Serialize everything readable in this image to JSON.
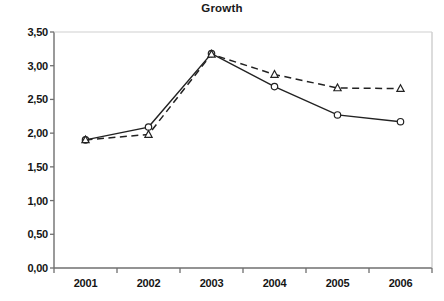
{
  "chart_data": {
    "type": "line",
    "title": "Growth",
    "xlabel": "",
    "ylabel": "",
    "categories": [
      "2001",
      "2002",
      "2003",
      "2004",
      "2005",
      "2006"
    ],
    "ylim": [
      0.0,
      3.5
    ],
    "ytick_step": 0.5,
    "ytick_labels": [
      "0,00",
      "0,50",
      "1,00",
      "1,50",
      "2,00",
      "2,50",
      "3,00",
      "3,50"
    ],
    "ytick_values": [
      0.0,
      0.5,
      1.0,
      1.5,
      2.0,
      2.5,
      3.0,
      3.5
    ],
    "grid": false,
    "legend": "none",
    "decimal_separator": ",",
    "series": [
      {
        "name": "series-1",
        "marker": "circle",
        "line_style": "solid",
        "color": "#222222",
        "values": [
          1.9,
          2.09,
          3.18,
          2.69,
          2.27,
          2.17
        ]
      },
      {
        "name": "series-2",
        "marker": "triangle",
        "line_style": "dashed",
        "color": "#222222",
        "values": [
          1.9,
          1.98,
          3.17,
          2.87,
          2.67,
          2.66
        ]
      }
    ]
  },
  "caption": {
    "text": ""
  },
  "colors": {
    "axis": "#6f6f6f",
    "text": "#151515",
    "line": "#222222",
    "plot_background": "#ffffff"
  }
}
